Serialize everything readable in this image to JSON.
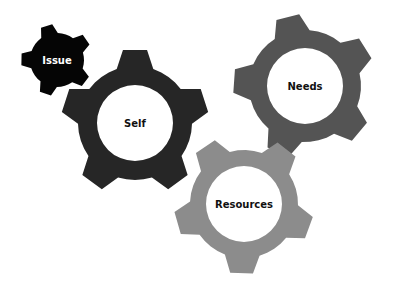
{
  "diagram": {
    "background": "#ffffff",
    "gears": [
      {
        "id": "issue",
        "label": "Issue",
        "cx": 57,
        "cy": 60,
        "outer_radius": 36,
        "root_radius": 27,
        "hole_radius": 0,
        "teeth": 5,
        "rotation_deg": -107,
        "fill": "#050505",
        "text_color": "#ffffff"
      },
      {
        "id": "self",
        "label": "Self",
        "cx": 135,
        "cy": 123,
        "outer_radius": 74,
        "root_radius": 57,
        "hole_radius": 38,
        "teeth": 5,
        "rotation_deg": -90,
        "fill": "#262626",
        "text_color": "#111111"
      },
      {
        "id": "needs",
        "label": "Needs",
        "cx": 305,
        "cy": 86,
        "outer_radius": 72,
        "root_radius": 56,
        "hole_radius": 38,
        "teeth": 5,
        "rotation_deg": -104,
        "fill": "#545454",
        "text_color": "#111111"
      },
      {
        "id": "resources",
        "label": "Resources",
        "cx": 244,
        "cy": 204,
        "outer_radius": 70,
        "root_radius": 54,
        "hole_radius": 38,
        "teeth": 5,
        "rotation_deg": -124,
        "fill": "#8c8c8c",
        "text_color": "#111111"
      }
    ]
  }
}
